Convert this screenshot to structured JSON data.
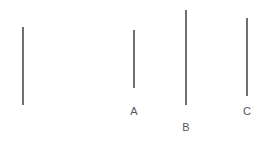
{
  "figure": {
    "background_color": "#ffffff",
    "line_color": "#4a4a52",
    "label_color": "#55555d",
    "line_width_px": 1.6,
    "canvas": {
      "width": 270,
      "height": 146
    }
  },
  "chart_data": {
    "type": "bar",
    "subtitle": "",
    "xlabel": "",
    "ylabel": "",
    "orientation": "vertical",
    "grid": false,
    "legend": false,
    "axis_visible": false,
    "categories": [
      "",
      "A",
      "B",
      "C"
    ],
    "values": [
      78,
      58,
      95,
      78
    ],
    "value_units": "px",
    "x_positions_px": [
      23,
      134,
      186,
      247
    ],
    "y_top_px": [
      27,
      30,
      10,
      18
    ],
    "y_bottom_px": [
      105,
      88,
      105,
      96
    ],
    "xlim": [
      0,
      270
    ],
    "ylim": [
      0,
      146
    ],
    "series": [
      {
        "name": "line length",
        "values": [
          78,
          58,
          95,
          78
        ]
      }
    ],
    "annotations": []
  },
  "lines": [
    {
      "id": "reference",
      "label": "",
      "label_visible": false,
      "x": 23,
      "y_top": 27,
      "y_bottom": 105,
      "length": 78
    },
    {
      "id": "a",
      "label": "A",
      "label_visible": true,
      "x": 134,
      "y_top": 30,
      "y_bottom": 88,
      "length": 58,
      "label_x": 134,
      "label_y": 115
    },
    {
      "id": "b",
      "label": "B",
      "label_visible": true,
      "x": 186,
      "y_top": 10,
      "y_bottom": 105,
      "length": 95,
      "label_x": 186,
      "label_y": 131
    },
    {
      "id": "c",
      "label": "C",
      "label_visible": true,
      "x": 247,
      "y_top": 18,
      "y_bottom": 96,
      "length": 78,
      "label_x": 247,
      "label_y": 115
    }
  ],
  "labels": {
    "a": "A",
    "b": "B",
    "c": "C"
  }
}
